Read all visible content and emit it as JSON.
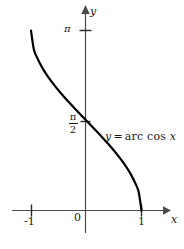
{
  "figure": {
    "background_color": "#ffffff",
    "ink_color": "#1a1a1a",
    "axis_color": "#4a4a4a",
    "curve_color": "#000000"
  },
  "axes": {
    "x_axis_label": "x",
    "y_axis_label": "y",
    "x_ticks": [
      {
        "label": "-1",
        "value": -1
      },
      {
        "label": "0",
        "value": 0
      },
      {
        "label": "1",
        "value": 1
      }
    ],
    "y_ticks": [
      {
        "label": "π",
        "value": 3.1416
      },
      {
        "label_numerator": "π",
        "label_denominator": "2",
        "value": 1.5708
      }
    ]
  },
  "annotation": {
    "y_symbol": "y",
    "equals": "=",
    "function_name": "arc cos",
    "x_symbol": "x",
    "full_text": "y = arc cos x"
  },
  "chart_data": {
    "type": "line",
    "title": "",
    "subtitle": "",
    "xlabel": "x",
    "ylabel": "y",
    "xlim": [
      -1.35,
      1.45
    ],
    "ylim": [
      -0.45,
      3.75
    ],
    "grid": false,
    "legend": null,
    "xticks": [
      -1,
      0,
      1
    ],
    "xticklabels": [
      "-1",
      "0",
      "1"
    ],
    "yticks": [
      1.5708,
      3.1416
    ],
    "yticklabels": [
      "π/2",
      "π"
    ],
    "annotations": [
      {
        "text": "y = arc cos x",
        "x": 0.35,
        "y": 1.28
      }
    ],
    "series": [
      {
        "name": "y = arc cos x",
        "color": "#000000",
        "linewidth": 2.2,
        "x": [
          -1.0,
          -0.95,
          -0.9,
          -0.8,
          -0.7,
          -0.6,
          -0.5,
          -0.4,
          -0.3,
          -0.2,
          -0.1,
          0.0,
          0.1,
          0.2,
          0.3,
          0.4,
          0.5,
          0.6,
          0.7,
          0.8,
          0.9,
          0.95,
          1.0
        ],
        "y": [
          3.1416,
          2.8198,
          2.6906,
          2.4981,
          2.3462,
          2.2143,
          2.0944,
          1.9823,
          1.8755,
          1.7722,
          1.671,
          1.5708,
          1.4706,
          1.3694,
          1.2661,
          1.1593,
          1.0472,
          0.9273,
          0.7954,
          0.6435,
          0.451,
          0.3176,
          0.0
        ]
      }
    ]
  }
}
